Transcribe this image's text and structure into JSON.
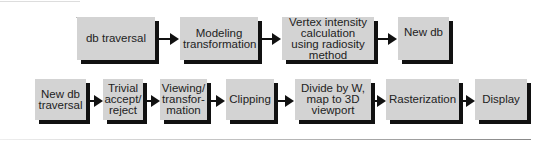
{
  "diagram": {
    "row1": [
      {
        "label": "db traversal"
      },
      {
        "label": "Modeling transformation"
      },
      {
        "label": "Vertex intensity calculation using radiosity method"
      },
      {
        "label": "New db"
      }
    ],
    "row2": [
      {
        "label": "New db traversal"
      },
      {
        "label": "Trivial accept/ reject"
      },
      {
        "label": "Viewing/ transfor- mation"
      },
      {
        "label": "Clipping"
      },
      {
        "label": "Divide by W, map to 3D viewport"
      },
      {
        "label": "Rasterization"
      },
      {
        "label": "Display"
      }
    ]
  },
  "colors": {
    "box_fill": "#d3d3d3",
    "shadow": "#111111",
    "arrow": "#111111"
  }
}
